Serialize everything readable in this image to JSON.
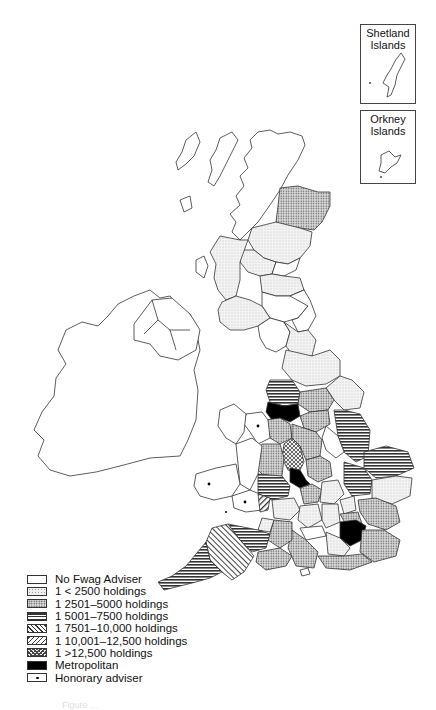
{
  "insets": [
    {
      "id": "shetland",
      "title_line1": "Shetland",
      "title_line2": "Islands"
    },
    {
      "id": "orkney",
      "title_line1": "Orkney",
      "title_line2": "Islands"
    }
  ],
  "legend": {
    "items": [
      {
        "id": "none",
        "pattern": "blank",
        "label": "No Fwag Adviser"
      },
      {
        "id": "lt2500",
        "pattern": "light-stipple",
        "label": "1  <  2500 holdings"
      },
      {
        "id": "2501-5000",
        "pattern": "dense-dots",
        "label": "1  2501–5000 holdings"
      },
      {
        "id": "5001-7500",
        "pattern": "horizontal-lines",
        "label": "1  5001–7500 holdings"
      },
      {
        "id": "7501-10000",
        "pattern": "back-diagonal",
        "label": "1  7501–10,000 holdings"
      },
      {
        "id": "10001-12500",
        "pattern": "forward-diagonal",
        "label": "1  10,001–12,500 holdings"
      },
      {
        "id": "gt12500",
        "pattern": "crosshatch",
        "label": "1  >12,500 holdings"
      },
      {
        "id": "metro",
        "pattern": "solid-black",
        "label": "Metropolitan"
      },
      {
        "id": "honorary",
        "pattern": "dot",
        "label": "Honorary adviser"
      }
    ]
  },
  "colors": {
    "outline": "#333333",
    "metropolitan": "#000000",
    "background": "#ffffff"
  },
  "caption": "Figure …"
}
